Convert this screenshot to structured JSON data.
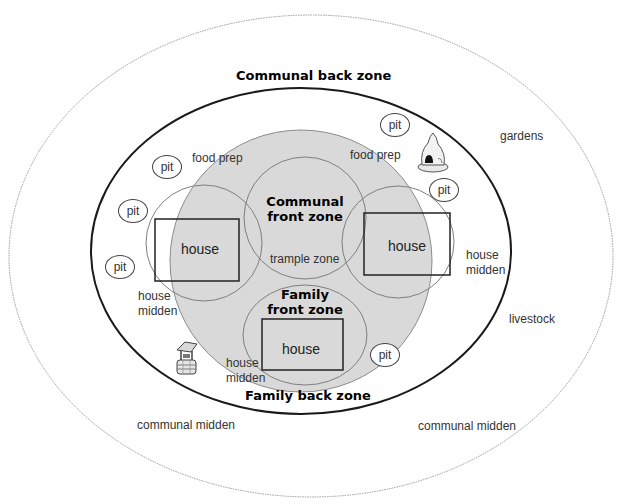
{
  "colors": {
    "front_zone_fill": "#d9d9d9",
    "outer_line": "#9a9a9a",
    "inner_line": "#1a1a1a",
    "circle_line": "#7f7f7f",
    "house_line": "#222222"
  },
  "zones": {
    "communal_back": "Communal back zone",
    "communal_front_line1": "Communal",
    "communal_front_line2": "front zone",
    "family_front_line1": "Family",
    "family_front_line2": "front zone",
    "family_back": "Family back zone",
    "trample": "trample zone"
  },
  "houses": [
    {
      "label": "house",
      "position": "left"
    },
    {
      "label": "house",
      "position": "right"
    },
    {
      "label": "house",
      "position": "bottom"
    }
  ],
  "pits": [
    {
      "label": "pit"
    },
    {
      "label": "pit"
    },
    {
      "label": "pit"
    },
    {
      "label": "pit"
    },
    {
      "label": "pit"
    },
    {
      "label": "pit"
    }
  ],
  "labels": {
    "food_prep_left": "food prep",
    "food_prep_right": "food prep",
    "gardens": "gardens",
    "livestock": "livestock",
    "house_midden_left_1": "house",
    "house_midden_left_2": "midden",
    "house_midden_right_1": "house",
    "house_midden_right_2": "midden",
    "house_midden_bottom_1": "house",
    "house_midden_bottom_2": "midden",
    "communal_midden_left": "communal midden",
    "communal_midden_right": "communal midden"
  },
  "icons": {
    "oven": "bread-oven-icon",
    "well": "well-icon"
  }
}
